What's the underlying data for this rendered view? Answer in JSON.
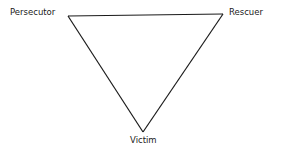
{
  "diagram": {
    "type": "triangle",
    "nodes": [
      {
        "id": "persecutor",
        "label": "Persecutor",
        "position": "top-left"
      },
      {
        "id": "rescuer",
        "label": "Rescuer",
        "position": "top-right"
      },
      {
        "id": "victim",
        "label": "Victim",
        "position": "bottom"
      }
    ],
    "edges": [
      {
        "from": "persecutor",
        "to": "rescuer"
      },
      {
        "from": "rescuer",
        "to": "victim"
      },
      {
        "from": "victim",
        "to": "persecutor"
      }
    ],
    "line_color": "#1a1a1a"
  }
}
